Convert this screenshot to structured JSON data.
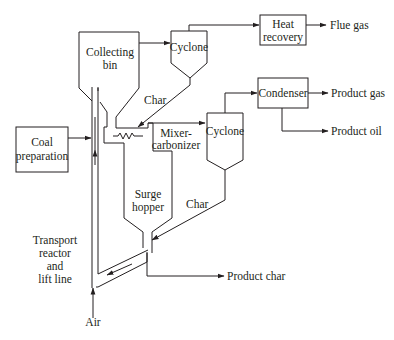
{
  "diagram": {
    "type": "process-flow",
    "units": {
      "collecting_bin": {
        "line1": "Collecting",
        "line2": "bin"
      },
      "cyclone_top": {
        "label": "Cyclone"
      },
      "heat_recovery": {
        "line1": "Heat",
        "line2": "recovery"
      },
      "condenser": {
        "label": "Condenser"
      },
      "cyclone_mid": {
        "label": "Cyclone"
      },
      "coal_preparation": {
        "line1": "Coal",
        "line2": "preparation"
      },
      "mixer_carbonizer": {
        "line1": "Mixer-",
        "line2": "carbonizer"
      },
      "surge_hopper": {
        "line1": "Surge",
        "line2": "hopper"
      },
      "transport_reactor": {
        "line1": "Transport",
        "line2": "reactor",
        "line3": "and",
        "line4": "lift line"
      }
    },
    "streams": {
      "flue_gas": "Flue gas",
      "product_gas": "Product gas",
      "product_oil": "Product oil",
      "product_char": "Product char",
      "char_top": "Char",
      "char_mid": "Char",
      "air": "Air"
    },
    "colors": {
      "line": "#231f20",
      "background": "#ffffff"
    }
  }
}
